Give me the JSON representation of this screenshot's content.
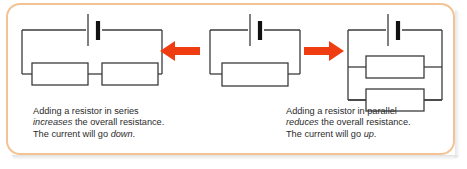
{
  "figure": {
    "frame_color": "#f3c394",
    "arrow_color": "#f03c11",
    "wire_color": "#3b3b3b"
  },
  "circuits": {
    "series": {
      "name": "series-circuit",
      "description": "Battery with two resistors in series",
      "resistor_count": 2,
      "battery_count": 1
    },
    "single": {
      "name": "single-resistor-circuit",
      "description": "Battery with one resistor",
      "resistor_count": 1,
      "battery_count": 1
    },
    "parallel": {
      "name": "parallel-circuit",
      "description": "Battery with two resistors in parallel",
      "resistor_count": 2,
      "battery_count": 1
    }
  },
  "arrows": {
    "left": {
      "direction": "left",
      "color": "#f03c11"
    },
    "right": {
      "direction": "right",
      "color": "#f03c11"
    }
  },
  "captions": {
    "series": {
      "line1_a": "Adding a resistor in series",
      "line2_em": "increases",
      "line2_b": " the overall resistance.",
      "line3_a": "The current will go ",
      "line3_em": "down",
      "line3_b": "."
    },
    "parallel": {
      "line1_a": "Adding a resistor in parallel",
      "line2_em": "reduces",
      "line2_b": " the overall resistance.",
      "line3_a": "The current will go ",
      "line3_em": "up",
      "line3_b": "."
    }
  }
}
